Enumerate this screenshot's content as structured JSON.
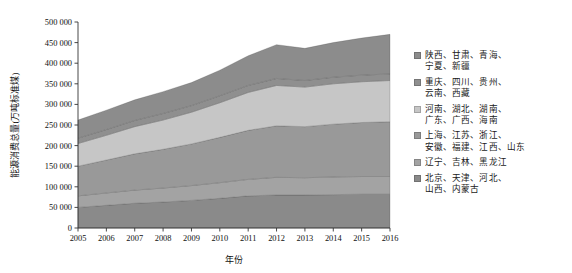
{
  "chart_data": {
    "type": "area",
    "stacked": true,
    "title": "",
    "xlabel": "年份",
    "ylabel": "能源消费总量(万吨标准煤)",
    "x": [
      2005,
      2006,
      2007,
      2008,
      2009,
      2010,
      2011,
      2012,
      2013,
      2014,
      2015,
      2016
    ],
    "xtick_labels": [
      "2005",
      "2006",
      "2007",
      "2008",
      "2009",
      "2010",
      "2011",
      "2012",
      "2013",
      "2014",
      "2015",
      "2016"
    ],
    "ytick_labels": [
      "0",
      "50 000",
      "100 000",
      "150 000",
      "200 000",
      "250 000",
      "300 000",
      "350 000",
      "400 000",
      "450 000",
      "500 000"
    ],
    "ytick_values": [
      0,
      50000,
      100000,
      150000,
      200000,
      250000,
      300000,
      350000,
      400000,
      450000,
      500000
    ],
    "ylim": [
      0,
      500000
    ],
    "xlim": [
      2005,
      2016
    ],
    "grid": false,
    "legend_position": "right",
    "stack_order_top_to_bottom": [
      0,
      1,
      2,
      3,
      4,
      5
    ],
    "series": [
      {
        "name": "陕西、甘肃、青海、宁夏、新疆",
        "label_lines": [
          "陕西、甘肃、青海、",
          "宁夏、新疆"
        ],
        "color": "#8c8c8c",
        "values": [
          44000,
          47000,
          50000,
          53000,
          56000,
          62000,
          72000,
          82000,
          78000,
          84000,
          90000,
          96000
        ]
      },
      {
        "name": "重庆、四川、贵州、云南、西藏",
        "label_lines": [
          "重庆、四川、贵州、",
          "云南、西藏"
        ],
        "color": "#8f8f8f",
        "values": [
          13000,
          14000,
          15000,
          16000,
          16000,
          17000,
          17000,
          17000,
          16000,
          16000,
          16000,
          16000
        ]
      },
      {
        "name": "河南、湖北、湖南、广东、广西、海南",
        "label_lines": [
          "河南、湖北、湖南、",
          "广东、广西、海南"
        ],
        "color": "#c6c6c6",
        "values": [
          55000,
          60000,
          66000,
          71000,
          77000,
          84000,
          92000,
          98000,
          96000,
          98000,
          99000,
          100000
        ]
      },
      {
        "name": "上海、江苏、浙江、安徽、福建、江西、山东",
        "label_lines": [
          "上海、江苏、浙江、",
          "安徽、福建、江西、山东"
        ],
        "color": "#999999",
        "values": [
          72000,
          80000,
          88000,
          94000,
          101000,
          110000,
          119000,
          125000,
          124000,
          128000,
          131000,
          133000
        ]
      },
      {
        "name": "辽宁、吉林、黑龙江",
        "label_lines": [
          "辽宁、吉林、黑龙江"
        ],
        "color": "#a3a3a3",
        "values": [
          28000,
          30000,
          32000,
          34000,
          36000,
          38000,
          40000,
          43000,
          42000,
          43000,
          43000,
          43000
        ]
      },
      {
        "name": "北京、天津、河北、山西、内蒙古",
        "label_lines": [
          "北京、天津、河北、",
          "山西、内蒙古"
        ],
        "color": "#8a8a8a",
        "values": [
          50000,
          55000,
          60000,
          63000,
          67000,
          72000,
          78000,
          80000,
          80000,
          81000,
          82000,
          82000
        ]
      }
    ],
    "totals": [
      262000,
      286000,
      311000,
      331000,
      353000,
      383000,
      418000,
      445000,
      436000,
      450000,
      461000,
      470000
    ]
  }
}
